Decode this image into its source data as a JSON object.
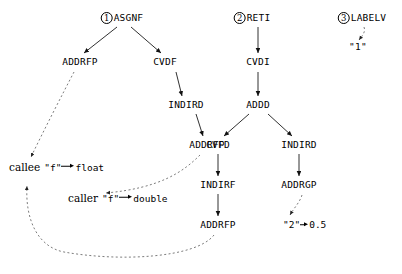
{
  "diagram": {
    "trees": [
      {
        "index_label": "1",
        "root": "ASGNF",
        "root_pos": {
          "x": 122,
          "y": 18
        },
        "nodes": [
          {
            "id": "t1-addrfp",
            "label": "ADDRFP",
            "x": 80,
            "y": 62
          },
          {
            "id": "t1-cvdf",
            "label": "CVDF",
            "x": 165,
            "y": 62
          },
          {
            "id": "t1-indird",
            "label": "INDIRD",
            "x": 186,
            "y": 105
          },
          {
            "id": "t1-addrfp2",
            "label": "ADDRFP",
            "x": 207,
            "y": 145
          }
        ]
      },
      {
        "index_label": "2",
        "root": "RETI",
        "root_pos": {
          "x": 252,
          "y": 18
        },
        "nodes": [
          {
            "id": "t2-cvdi",
            "label": "CVDI",
            "x": 258,
            "y": 62
          },
          {
            "id": "t2-addd",
            "label": "ADDD",
            "x": 258,
            "y": 105
          },
          {
            "id": "t2-cvfd",
            "label": "CVFD",
            "x": 218,
            "y": 145
          },
          {
            "id": "t2-indird",
            "label": "INDIRD",
            "x": 299,
            "y": 145
          },
          {
            "id": "t2-indirf",
            "label": "INDIRF",
            "x": 218,
            "y": 185
          },
          {
            "id": "t2-addrgp",
            "label": "ADDRGP",
            "x": 299,
            "y": 185
          },
          {
            "id": "t2-addrfp",
            "label": "ADDRFP",
            "x": 218,
            "y": 225
          }
        ]
      },
      {
        "index_label": "3",
        "root": "LABELV",
        "root_pos": {
          "x": 362,
          "y": 18
        },
        "nodes": []
      }
    ],
    "symbols": [
      {
        "id": "sym-label1",
        "kind": "string-literal",
        "value": "\"1\"",
        "x": 358,
        "y": 47
      },
      {
        "id": "sym-callee",
        "kind": "symbol-binding",
        "scope": "callee",
        "name": "\"f\"",
        "value": "float",
        "x": 9,
        "y": 167
      },
      {
        "id": "sym-caller",
        "kind": "symbol-binding",
        "scope": "caller",
        "name": "\"f\"",
        "value": "double",
        "x": 68,
        "y": 198
      },
      {
        "id": "sym-const2",
        "kind": "constant-binding",
        "name": "\"2\"",
        "value": "0.5",
        "x": 283,
        "y": 225
      }
    ],
    "solid_edges": [
      {
        "from": "ASGNF",
        "to": "ADDRFP",
        "x1": 117,
        "y1": 27,
        "x2": 84,
        "y2": 53
      },
      {
        "from": "ASGNF",
        "to": "CVDF",
        "x1": 131,
        "y1": 27,
        "x2": 161,
        "y2": 53
      },
      {
        "from": "CVDF",
        "to": "INDIRD",
        "x1": 176,
        "y1": 72,
        "x2": 182,
        "y2": 96
      },
      {
        "from": "INDIRD",
        "to": "ADDRFP",
        "x1": 196,
        "y1": 114,
        "x2": 203,
        "y2": 136
      },
      {
        "from": "RETI",
        "to": "CVDI",
        "x1": 258,
        "y1": 27,
        "x2": 258,
        "y2": 53
      },
      {
        "from": "CVDI",
        "to": "ADDD",
        "x1": 258,
        "y1": 72,
        "x2": 258,
        "y2": 96
      },
      {
        "from": "ADDD",
        "to": "CVFD",
        "x1": 249,
        "y1": 114,
        "x2": 224,
        "y2": 136
      },
      {
        "from": "ADDD",
        "to": "INDIRD",
        "x1": 268,
        "y1": 114,
        "x2": 292,
        "y2": 136
      },
      {
        "from": "CVFD",
        "to": "INDIRF",
        "x1": 218,
        "y1": 154,
        "x2": 218,
        "y2": 176
      },
      {
        "from": "INDIRD",
        "to": "ADDRGP",
        "x1": 299,
        "y1": 154,
        "x2": 299,
        "y2": 176
      },
      {
        "from": "INDIRF",
        "to": "ADDRFP",
        "x1": 218,
        "y1": 194,
        "x2": 218,
        "y2": 216
      }
    ],
    "dashed_edges": [
      {
        "from": "LABELV",
        "to": "sym-label1",
        "d": "M 364 27 C 366 32 362 36 359 40"
      },
      {
        "from": "t1-addrfp",
        "to": "sym-callee",
        "d": "M 74 72 C 62 95 44 130 31 157"
      },
      {
        "from": "t1-addrfp2",
        "to": "sym-caller",
        "d": "M 200 155 C 183 172 160 188 106 193"
      },
      {
        "from": "t2-addrfp",
        "to": "sym-callee",
        "d": "M 214 235 C 196 258 120 262 64 252 C 38 247 25 220 27 186"
      },
      {
        "from": "t2-addrgp",
        "to": "sym-const2",
        "d": "M 302 195 C 300 202 294 208 290 215"
      }
    ]
  }
}
